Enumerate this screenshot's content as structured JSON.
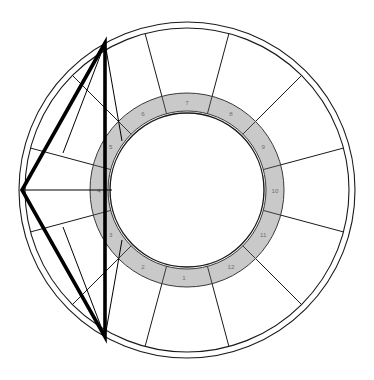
{
  "chart": {
    "type": "astrological-wheel",
    "center": {
      "x": 187,
      "y": 190
    },
    "rings": {
      "outer_circle_radius": 168,
      "second_circle_radius": 162,
      "zodiac_band_outer_radius": 97,
      "zodiac_band_inner_radius": 79,
      "inner_circle_radius": 77
    },
    "colors": {
      "background": "#ffffff",
      "line": "#1a1a1a",
      "band_fill": "#c9c9c9",
      "band_stroke": "#3a3a3a",
      "inner_fill": "#ffffff",
      "house_number_text": "#6f6f6f",
      "aspect_line": "#000000"
    },
    "stroke_widths": {
      "outer_circle": 1.1,
      "second_circle": 1.1,
      "band_edge": 1.0,
      "inner_circle": 1.4,
      "house_spoke": 1.0,
      "cusp_divider": 1.0,
      "aspect_line": 3.6,
      "thin_aspect_line": 1.0
    },
    "houses": [
      {
        "number": "1",
        "cusp_angle_deg": 255,
        "label_angle_deg": 268
      },
      {
        "number": "2",
        "cusp_angle_deg": 225,
        "label_angle_deg": 240
      },
      {
        "number": "3",
        "cusp_angle_deg": 195,
        "label_angle_deg": 210
      },
      {
        "number": "4",
        "cusp_angle_deg": 165,
        "label_angle_deg": 180
      },
      {
        "number": "5",
        "cusp_angle_deg": 135,
        "label_angle_deg": 150
      },
      {
        "number": "6",
        "cusp_angle_deg": 105,
        "label_angle_deg": 120
      },
      {
        "number": "7",
        "cusp_angle_deg": 75,
        "label_angle_deg": 90
      },
      {
        "number": "8",
        "cusp_angle_deg": 45,
        "label_angle_deg": 60
      },
      {
        "number": "9",
        "cusp_angle_deg": 15,
        "label_angle_deg": 30
      },
      {
        "number": "10",
        "cusp_angle_deg": 345,
        "label_angle_deg": 0
      },
      {
        "number": "11",
        "cusp_angle_deg": 315,
        "label_angle_deg": 330
      },
      {
        "number": "12",
        "cusp_angle_deg": 285,
        "label_angle_deg": 300
      }
    ],
    "aspect_triangle": {
      "name": "aspect-triangle",
      "vertices": [
        {
          "id": "top",
          "x": 105,
          "y": 43
        },
        {
          "id": "left",
          "x": 22,
          "y": 190
        },
        {
          "id": "bottom",
          "x": 105,
          "y": 337
        }
      ]
    },
    "thin_aspect_lines": [
      {
        "from": {
          "x": 105,
          "y": 43
        },
        "to": {
          "x": 122,
          "y": 141
        }
      },
      {
        "from": {
          "x": 105,
          "y": 43
        },
        "to": {
          "x": 63,
          "y": 153
        }
      },
      {
        "from": {
          "x": 22,
          "y": 190
        },
        "to": {
          "x": 112,
          "y": 190
        }
      },
      {
        "from": {
          "x": 105,
          "y": 337
        },
        "to": {
          "x": 122,
          "y": 240
        }
      },
      {
        "from": {
          "x": 105,
          "y": 337
        },
        "to": {
          "x": 63,
          "y": 227
        }
      }
    ]
  }
}
